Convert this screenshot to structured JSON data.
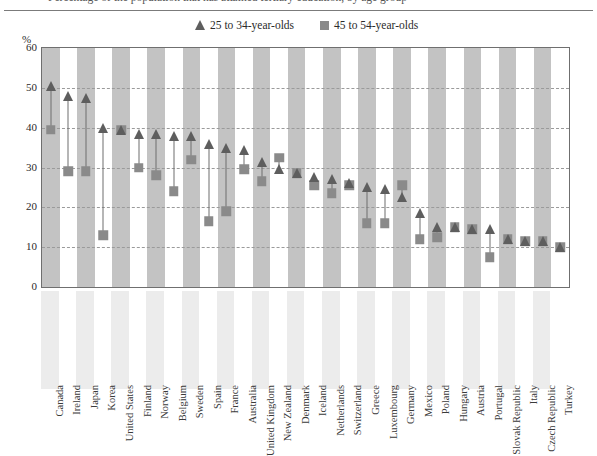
{
  "figure": {
    "title_fragment": "Percentage of the population that has attained tertiary education, by age group",
    "y_axis_unit": "%"
  },
  "legend": {
    "items": [
      {
        "marker": "triangle-marker",
        "label": "25 to 34-year-olds",
        "color": "#5e5e5e"
      },
      {
        "marker": "square-marker",
        "label": "45 to 54-year-olds",
        "color": "#8a8a8a"
      }
    ]
  },
  "chart_data": {
    "type": "scatter",
    "title": "",
    "xlabel": "",
    "ylabel": "%",
    "ylim": [
      0,
      60
    ],
    "yticks": [
      0,
      10,
      20,
      30,
      40,
      50,
      60
    ],
    "grid": true,
    "legend_position": "top",
    "categories": [
      "Canada",
      "Ireland",
      "Japan",
      "Korea",
      "United States",
      "Finland",
      "Norway",
      "Belgium",
      "Sweden",
      "Spain",
      "France",
      "Australia",
      "United Kingdom",
      "New Zealand",
      "Denmark",
      "Iceland",
      "Netherlands",
      "Switzerland",
      "Greece",
      "Luxembourg",
      "Germany",
      "Mexico",
      "Poland",
      "Hungary",
      "Austria",
      "Portugal",
      "Slovak Republic",
      "Italy",
      "Czech Republic",
      "Turkey"
    ],
    "series": [
      {
        "name": "25 to 34-year-olds",
        "marker": "triangle",
        "color": "#5e5e5e",
        "values": [
          50.5,
          48.0,
          47.5,
          40.0,
          39.5,
          38.5,
          38.5,
          38.0,
          38.0,
          36.0,
          35.0,
          34.5,
          31.5,
          29.5,
          28.5,
          27.5,
          27.0,
          26.0,
          25.0,
          24.5,
          22.5,
          18.5,
          15.0,
          15.0,
          14.5,
          14.5,
          12.0,
          11.5,
          11.5,
          10.0
        ]
      },
      {
        "name": "45 to 54-year-olds",
        "marker": "square",
        "color": "#8a8a8a",
        "values": [
          39.5,
          29.0,
          29.0,
          13.0,
          39.5,
          30.0,
          28.0,
          24.0,
          32.0,
          16.5,
          19.0,
          29.5,
          26.5,
          32.5,
          28.5,
          25.5,
          23.5,
          25.5,
          16.0,
          16.0,
          25.5,
          12.0,
          12.5,
          15.0,
          14.5,
          7.5,
          12.0,
          11.5,
          11.5,
          10.0
        ]
      }
    ]
  }
}
